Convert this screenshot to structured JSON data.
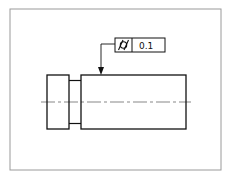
{
  "drawing": {
    "feature_control_frame": {
      "symbol": "cylindricity-icon",
      "tolerance": "0.1"
    },
    "colors": {
      "line": "#111111",
      "frame": "#9a9a9a",
      "centerline": "#555555",
      "background": "#ffffff"
    }
  }
}
